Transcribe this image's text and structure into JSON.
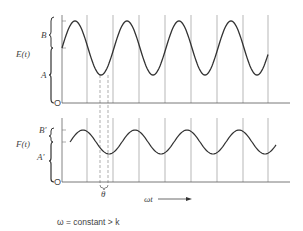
{
  "top_panel": {
    "function_label": "E(t)",
    "upper_bracket_label": "B",
    "lower_bracket_label": "A",
    "origin_label": "O"
  },
  "bottom_panel": {
    "function_label": "F(t)",
    "upper_bracket_label": "B'",
    "lower_bracket_label": "A'",
    "origin_label": "O",
    "phase_label": "θ"
  },
  "x_axis_label": "ωt",
  "caption": "ω = constant > k",
  "gridlines_x": [
    87,
    113,
    139,
    165,
    191,
    217,
    243,
    268
  ],
  "phase_dashed_x": [
    100,
    108
  ],
  "waves": {
    "E": {
      "x_start": 62,
      "x_end": 268,
      "center_y": 48,
      "amplitude": 27,
      "period_px": 52,
      "first_peak_x": 75
    },
    "F": {
      "x_start": 70,
      "x_end": 276,
      "center_y": 142,
      "amplitude": 12,
      "period_px": 52,
      "first_peak_x": 83
    }
  },
  "colors": {
    "curve": "#333333",
    "grid": "#888888",
    "axis": "#555555"
  }
}
